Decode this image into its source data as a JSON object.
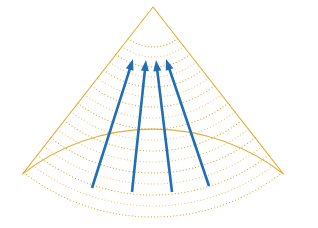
{
  "figure": {
    "title": "",
    "caption": "",
    "background_color": "#ffffff",
    "width": 318,
    "height": 228
  },
  "colors": {
    "wavefront_dotted": "#e0a93a",
    "wavefront_dotted_light": "#eec77a",
    "sector_outline": "#e3b13c",
    "ray_arrow": "#1f6fb4",
    "background": "#ffffff"
  },
  "chart_data": {
    "type": "diagram",
    "title": "",
    "sector": {
      "apex_x": 153,
      "apex_y": 7,
      "half_angle_deg": 38,
      "inner_radius": 28,
      "outer_radius": 212,
      "left_corner": [
        18,
        152
      ],
      "right_corner": [
        298,
        152
      ],
      "bottom_y": 219,
      "outline_style": "solid",
      "outline_width": 1.1
    },
    "wavefronts": {
      "count": 17,
      "style": "dotted",
      "dot_radius": 0.62,
      "dot_spacing": 3.2,
      "radii": [
        40,
        50,
        60,
        70,
        80,
        90,
        100,
        111,
        122,
        133,
        144,
        155,
        166,
        177,
        188,
        199,
        210
      ],
      "label": "wavefront arcs"
    },
    "rays": [
      {
        "name": "ray-1",
        "tail": [
          92,
          188
        ],
        "tip": [
          133,
          59
        ],
        "angle_deg": -72.4
      },
      {
        "name": "ray-2",
        "tail": [
          132,
          192
        ],
        "tip": [
          146,
          60
        ],
        "angle_deg": -84.0
      },
      {
        "name": "ray-3",
        "tail": [
          172,
          192
        ],
        "tip": [
          156,
          60
        ],
        "angle_deg": -96.9
      },
      {
        "name": "ray-4",
        "tail": [
          209,
          186
        ],
        "tip": [
          166,
          59
        ],
        "angle_deg": -108.7
      }
    ],
    "ray_style": {
      "stroke_width": 2.6,
      "arrowhead_length": 11,
      "arrowhead_width": 8,
      "color": "#1f6fb4"
    },
    "axis_labels": [],
    "tick_labels": [],
    "legend": [],
    "annotations": []
  }
}
